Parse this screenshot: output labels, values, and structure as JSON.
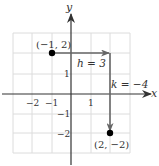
{
  "diagram": {
    "type": "coordinate-translation",
    "axes": {
      "x_label": "x",
      "y_label": "y"
    },
    "x_ticks": [
      {
        "value": -2,
        "label": "−2"
      },
      {
        "value": -1,
        "label": "−1"
      },
      {
        "value": 1,
        "label": "1"
      }
    ],
    "y_ticks": [
      {
        "value": 1,
        "label": "1"
      },
      {
        "value": -1,
        "label": "−1"
      },
      {
        "value": -2,
        "label": "−2"
      }
    ],
    "grid": {
      "x_range": [
        -3,
        3
      ],
      "y_range": [
        -3,
        3
      ]
    },
    "points": [
      {
        "name": "start",
        "x": -1,
        "y": 2,
        "label": "(−1, 2)"
      },
      {
        "name": "end",
        "x": 2,
        "y": -2,
        "label": "(2, −2)"
      }
    ],
    "translations": {
      "horizontal": {
        "label": "h = 3",
        "from": [
          -1,
          2
        ],
        "to": [
          2,
          2
        ]
      },
      "vertical": {
        "label": "k = −4",
        "from": [
          2,
          2
        ],
        "to": [
          2,
          -2
        ]
      }
    },
    "colors": {
      "axis": "#333333",
      "grid": "#d9d9d9",
      "arrow": "#666666",
      "point": "#000000"
    }
  }
}
